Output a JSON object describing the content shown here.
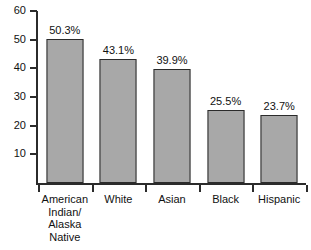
{
  "chart_data": {
    "type": "bar",
    "title": "",
    "subtitle": "",
    "xlabel": "",
    "ylabel": "",
    "ylim": [
      0,
      60
    ],
    "yticks": [
      0,
      10,
      20,
      30,
      40,
      50,
      60
    ],
    "ytick_labels": [
      "",
      "10",
      "20",
      "30",
      "40",
      "50",
      "60"
    ],
    "grid": false,
    "legend": false,
    "categories": [
      "American Indian/ Alaska Native",
      "White",
      "Asian",
      "Black",
      "Hispanic"
    ],
    "category_lines": [
      [
        "American",
        "Indian/",
        "Alaska",
        "Native"
      ],
      [
        "White"
      ],
      [
        "Asian"
      ],
      [
        "Black"
      ],
      [
        "Hispanic"
      ]
    ],
    "values": [
      50.3,
      43.1,
      39.9,
      25.5,
      23.7
    ],
    "data_labels": [
      "50.3%",
      "43.1%",
      "39.9%",
      "25.5%",
      "23.7%"
    ],
    "bar_color": "#a8a8a8",
    "bar_border_color": "#2b2b2b",
    "axis_color": "#2b2b2b",
    "text_color": "#111111",
    "background_color": "#ffffff"
  }
}
